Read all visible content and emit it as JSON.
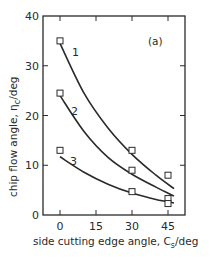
{
  "chart_data": {
    "type": "scatter",
    "title": "",
    "panel_label": "(a)",
    "xlabel": "side cutting edge angle, C",
    "xlabel_sub": "s",
    "xlabel_unit": "/deg",
    "ylabel": "chip flow angle, η",
    "ylabel_sub": "c",
    "ylabel_unit": "/deg",
    "xlim": [
      -7,
      50
    ],
    "ylim": [
      0,
      40
    ],
    "x_ticks": [
      0,
      15,
      30,
      45
    ],
    "y_ticks": [
      0,
      10,
      20,
      30,
      40
    ],
    "grid": false,
    "legend": "curve labels inline (1, 2, 3)",
    "series": [
      {
        "name": "1",
        "points": [
          {
            "x": 0,
            "y": 35
          },
          {
            "x": 30,
            "y": 13
          },
          {
            "x": 45,
            "y": 8
          }
        ],
        "fit_curve": [
          [
            0,
            34.5
          ],
          [
            10,
            24.5
          ],
          [
            20,
            17.5
          ],
          [
            30,
            12.2
          ],
          [
            40,
            8.0
          ],
          [
            47.5,
            5.3
          ]
        ]
      },
      {
        "name": "2",
        "points": [
          {
            "x": 0,
            "y": 24.5
          },
          {
            "x": 30,
            "y": 9
          },
          {
            "x": 45,
            "y": 3.3
          }
        ],
        "fit_curve": [
          [
            0,
            24
          ],
          [
            10,
            16.8
          ],
          [
            20,
            11.6
          ],
          [
            30,
            8.2
          ],
          [
            40,
            5.6
          ],
          [
            47.5,
            3.8
          ]
        ]
      },
      {
        "name": "3",
        "points": [
          {
            "x": 0,
            "y": 13
          },
          {
            "x": 30,
            "y": 4.7
          },
          {
            "x": 45,
            "y": 2.3
          }
        ],
        "fit_curve": [
          [
            0,
            11.7
          ],
          [
            10,
            8.6
          ],
          [
            20,
            6.2
          ],
          [
            30,
            4.4
          ],
          [
            40,
            3.1
          ],
          [
            47.5,
            2.4
          ]
        ]
      }
    ]
  }
}
